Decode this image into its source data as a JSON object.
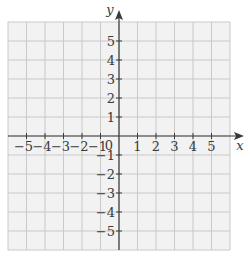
{
  "diagram": {
    "type": "coordinate-plane",
    "x_axis": {
      "label": "x",
      "ticks": [
        -5,
        -4,
        -3,
        -2,
        -1,
        1,
        2,
        3,
        4,
        5
      ],
      "tick_labels": [
        "−5",
        "−4",
        "−3",
        "−2",
        "−1",
        "1",
        "2",
        "3",
        "4",
        "5"
      ]
    },
    "y_axis": {
      "label": "y",
      "ticks": [
        5,
        4,
        3,
        2,
        1,
        -1,
        -2,
        -3,
        -4,
        -5
      ],
      "tick_labels": [
        "5",
        "4",
        "3",
        "2",
        "1",
        "−1",
        "−2",
        "−3",
        "−4",
        "−5"
      ]
    },
    "origin_label": "0",
    "grid": {
      "columns": 12,
      "rows": 12,
      "x_range": [
        -6,
        6
      ],
      "y_range": [
        -6,
        6
      ]
    },
    "colors": {
      "grid_fill": "#f2f2f2",
      "grid_line": "#c8c8c8",
      "axis": "#3a3a3a",
      "text": "#3a3a3a"
    }
  }
}
